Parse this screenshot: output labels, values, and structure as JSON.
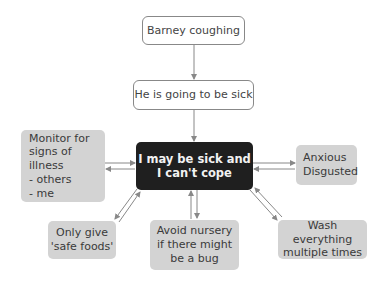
{
  "diagram": {
    "nodes": {
      "trigger": {
        "label": "Barney coughing"
      },
      "thought": {
        "label": "He is going to be sick"
      },
      "core": {
        "label": "I may be sick and\nI can't cope"
      },
      "monitor": {
        "label": "Monitor for\nsigns of illness\n- others\n- me"
      },
      "emotions": {
        "label": "Anxious\nDisgusted"
      },
      "safe_foods": {
        "label": "Only give\n'safe foods'"
      },
      "nursery": {
        "label": "Avoid nursery\nif there might\nbe a bug"
      },
      "wash": {
        "label": "Wash everything\nmultiple times"
      }
    },
    "colors": {
      "dark_node": "#1f1f1f",
      "grey_node": "#d3d3d3",
      "arrow": "#888888"
    }
  }
}
